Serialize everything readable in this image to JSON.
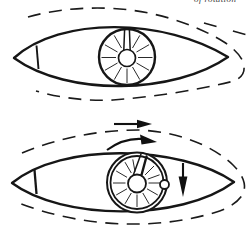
{
  "meta": {
    "background": "#ffffff",
    "ink": "#161616",
    "figure_count": 2
  },
  "clipped_text": {
    "fragment": "of rotation"
  },
  "figures": {
    "top": {
      "name": "body-with-rotor-at-rest",
      "streamline_style": "dashed contour around body, open at left, wrapping right tip",
      "nose_cap": "small divided cap at left tip",
      "keyway_direction": "up",
      "spoke_count": 11
    },
    "bottom": {
      "name": "body-with-spinning-rotor",
      "streamline_style": "dashed contour around body, open at left, wrapping right tip",
      "nose_cap": "small divided cap at left tip",
      "keyway_direction": "up-right",
      "rim_detail": "double rim with small ball at 3 o'clock",
      "spoke_count": 12,
      "arrows": [
        {
          "name": "freestream-arrow",
          "direction": "right"
        },
        {
          "name": "rotation-arrow",
          "direction": "clockwise"
        },
        {
          "name": "descent-arrow",
          "direction": "down"
        }
      ]
    }
  },
  "wheels": {
    "top": {
      "cx": 127,
      "cy": 57.5,
      "r1": 11,
      "r2": 25.5,
      "angles": [
        0,
        30,
        60,
        90,
        120,
        150,
        180,
        210,
        240,
        300,
        330
      ]
    },
    "bottom": {
      "cx": 137,
      "cy": 183,
      "r1": 11.5,
      "r2": 24,
      "angles": [
        0,
        30,
        60,
        90,
        120,
        150,
        180,
        210,
        240,
        260,
        315,
        340
      ]
    }
  }
}
